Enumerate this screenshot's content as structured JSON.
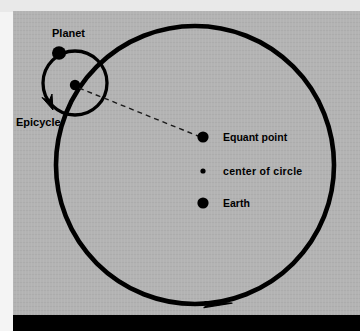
{
  "figure": {
    "background_color": "#b3b3b3",
    "stroke_color": "#000000",
    "bottom_bar_color": "#000000",
    "top_strip_color": "#e9e9e9"
  },
  "labels": {
    "planet": "Planet",
    "epicycle": "Epicycle"
  },
  "legend": {
    "items": [
      {
        "label": "Equant point",
        "marker": "large-dot",
        "marker_diameter_px": 11
      },
      {
        "label": "center of circle",
        "marker": "small-dot",
        "marker_diameter_px": 5
      },
      {
        "label": "Earth",
        "marker": "large-dot",
        "marker_diameter_px": 11
      }
    ]
  },
  "geometry": {
    "deferent": {
      "name": "deferent-circle",
      "center": [
        195,
        165
      ],
      "radius": 139,
      "stroke_width": 4.5,
      "direction_arrow": "counterclockwise-at-bottom"
    },
    "epicycle": {
      "name": "epicycle-circle",
      "center": [
        75,
        83
      ],
      "radius": 32,
      "stroke_width": 3.2,
      "direction_arrow": "clockwise-at-lower-left"
    },
    "planet_dot": {
      "center": [
        59,
        53
      ],
      "diameter": 13
    },
    "epicycle_center_dot": {
      "center": [
        75,
        85
      ],
      "diameter": 10
    },
    "equant_dot": {
      "center": [
        203,
        137
      ],
      "diameter": 11
    },
    "center_of_circle_dot": {
      "center": [
        203,
        171
      ],
      "diameter": 5
    },
    "earth_dot": {
      "center": [
        203,
        203
      ],
      "diameter": 11
    },
    "dashed_line": {
      "from": [
        78,
        87
      ],
      "to": [
        199,
        136
      ],
      "dash": "5,4",
      "stroke_width": 1.3
    }
  }
}
